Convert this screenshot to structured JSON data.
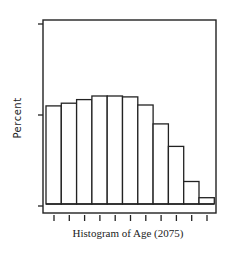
{
  "chart_data": {
    "type": "bar",
    "subtype": "histogram",
    "title": "",
    "xlabel": "Histogram of Age (2075)",
    "ylabel": "Percent",
    "categories": [
      "bin1",
      "bin2",
      "bin3",
      "bin4",
      "bin5",
      "bin6",
      "bin7",
      "bin8",
      "bin9",
      "bin10",
      "bin11"
    ],
    "values": [
      10.9,
      11.2,
      11.6,
      12.0,
      12.0,
      11.9,
      11.0,
      8.9,
      6.4,
      2.5,
      0.7
    ],
    "ylim": [
      0,
      20
    ],
    "y_ticks_count": 3,
    "x_ticks_count": 11,
    "tick_labels_shown": false,
    "grid": false,
    "legend": "none",
    "bar_fill": "#ffffff",
    "bar_edge": "#222222"
  },
  "layout": {
    "frame": {
      "x": 43,
      "y": 20,
      "w": 173,
      "h": 193
    },
    "baseline_y": 204,
    "bar_left_x": 46,
    "bar_width": 15.3,
    "px_per_unit": 9.0
  }
}
